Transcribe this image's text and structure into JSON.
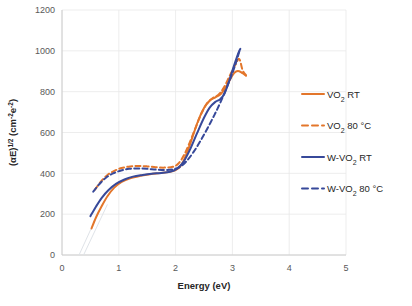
{
  "chart_data": {
    "type": "line",
    "title": "",
    "xlabel": "Energy (eV)",
    "ylabel_parts": {
      "base1": "(αE)",
      "sup1": "1/2",
      "base2": " (cm",
      "sup2": "-2",
      "base3": "e",
      "sup3": "-2",
      "base4": ")"
    },
    "xlim": [
      0,
      5
    ],
    "ylim": [
      0,
      1200
    ],
    "xticks": [
      "0",
      "1",
      "2",
      "3",
      "4",
      "5"
    ],
    "yticks": [
      "0",
      "200",
      "400",
      "600",
      "800",
      "1000",
      "1200"
    ],
    "grid": true,
    "legend_position": "right",
    "colors": {
      "orange": "#E3762B",
      "blue": "#37499A",
      "grid": "#E8E8E8",
      "axis": "#C8C8C8",
      "extrapolation": "#DFE3E8",
      "text": "#262626",
      "tick_text": "#595959"
    },
    "series": [
      {
        "name": "VO₂ RT",
        "label_base": "VO",
        "label_sub": "2",
        "label_tail": " RT",
        "color": "#E3762B",
        "dash": "solid",
        "points": [
          [
            0.52,
            130
          ],
          [
            0.6,
            185
          ],
          [
            0.7,
            240
          ],
          [
            0.8,
            288
          ],
          [
            0.92,
            330
          ],
          [
            1.05,
            358
          ],
          [
            1.2,
            376
          ],
          [
            1.38,
            388
          ],
          [
            1.55,
            396
          ],
          [
            1.72,
            401
          ],
          [
            1.88,
            406
          ],
          [
            2.0,
            416
          ],
          [
            2.1,
            440
          ],
          [
            2.2,
            500
          ],
          [
            2.3,
            580
          ],
          [
            2.4,
            660
          ],
          [
            2.5,
            720
          ],
          [
            2.6,
            756
          ],
          [
            2.7,
            772
          ],
          [
            2.8,
            790
          ],
          [
            2.9,
            830
          ],
          [
            3.0,
            880
          ],
          [
            3.06,
            898
          ],
          [
            3.12,
            900
          ],
          [
            3.18,
            890
          ],
          [
            3.24,
            878
          ]
        ]
      },
      {
        "name": "VO₂ 80 °C",
        "label_base": "VO",
        "label_sub": "2",
        "label_tail": " 80 °C",
        "color": "#E3762B",
        "dash": "dashed",
        "points": [
          [
            0.58,
            320
          ],
          [
            0.68,
            358
          ],
          [
            0.8,
            392
          ],
          [
            0.92,
            412
          ],
          [
            1.05,
            426
          ],
          [
            1.2,
            434
          ],
          [
            1.35,
            436
          ],
          [
            1.5,
            434
          ],
          [
            1.65,
            430
          ],
          [
            1.8,
            428
          ],
          [
            1.95,
            432
          ],
          [
            2.05,
            448
          ],
          [
            2.15,
            490
          ],
          [
            2.25,
            552
          ],
          [
            2.35,
            622
          ],
          [
            2.45,
            690
          ],
          [
            2.55,
            742
          ],
          [
            2.65,
            768
          ],
          [
            2.75,
            784
          ],
          [
            2.85,
            820
          ],
          [
            2.95,
            876
          ],
          [
            3.05,
            930
          ],
          [
            3.12,
            960
          ],
          [
            3.18,
            905
          ],
          [
            3.24,
            880
          ]
        ]
      },
      {
        "name": "W-VO₂ RT",
        "label_base": "W-VO",
        "label_sub": "2",
        "label_tail": " RT",
        "color": "#37499A",
        "dash": "solid",
        "points": [
          [
            0.5,
            190
          ],
          [
            0.6,
            238
          ],
          [
            0.7,
            280
          ],
          [
            0.82,
            318
          ],
          [
            0.95,
            348
          ],
          [
            1.1,
            370
          ],
          [
            1.25,
            384
          ],
          [
            1.42,
            392
          ],
          [
            1.58,
            398
          ],
          [
            1.75,
            402
          ],
          [
            1.9,
            408
          ],
          [
            2.02,
            422
          ],
          [
            2.14,
            456
          ],
          [
            2.26,
            520
          ],
          [
            2.38,
            598
          ],
          [
            2.5,
            672
          ],
          [
            2.6,
            722
          ],
          [
            2.7,
            750
          ],
          [
            2.78,
            762
          ],
          [
            2.86,
            790
          ],
          [
            2.94,
            850
          ],
          [
            3.02,
            920
          ],
          [
            3.1,
            985
          ],
          [
            3.14,
            1010
          ]
        ]
      },
      {
        "name": "W-VO₂ 80 °C",
        "label_base": "W-VO",
        "label_sub": "2",
        "label_tail": " 80 °C",
        "color": "#37499A",
        "dash": "dashed",
        "points": [
          [
            0.55,
            310
          ],
          [
            0.66,
            348
          ],
          [
            0.78,
            380
          ],
          [
            0.9,
            400
          ],
          [
            1.04,
            414
          ],
          [
            1.18,
            422
          ],
          [
            1.34,
            424
          ],
          [
            1.5,
            422
          ],
          [
            1.66,
            418
          ],
          [
            1.82,
            416
          ],
          [
            1.96,
            420
          ],
          [
            2.08,
            432
          ],
          [
            2.2,
            462
          ],
          [
            2.32,
            506
          ],
          [
            2.44,
            560
          ],
          [
            2.56,
            620
          ],
          [
            2.68,
            684
          ],
          [
            2.78,
            742
          ],
          [
            2.88,
            806
          ],
          [
            2.98,
            876
          ],
          [
            3.06,
            940
          ],
          [
            3.13,
            1005
          ]
        ]
      }
    ],
    "extrapolation_lines": [
      {
        "from": [
          0.3,
          0
        ],
        "to": [
          0.72,
          255
        ],
        "color": "#DFE3E8"
      },
      {
        "from": [
          0.38,
          0
        ],
        "to": [
          0.8,
          248
        ],
        "color": "#DFE3E8"
      }
    ]
  }
}
